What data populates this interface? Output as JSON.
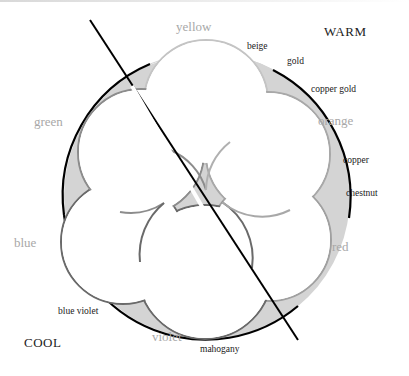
{
  "diagram": {
    "type": "hair-color-wheel",
    "temperature_labels": {
      "warm": "WARM",
      "cool": "COOL"
    },
    "primary_colors": [
      {
        "key": "yellow",
        "label": "yellow"
      },
      {
        "key": "orange",
        "label": "orange"
      },
      {
        "key": "red",
        "label": "red"
      },
      {
        "key": "violet",
        "label": "violet"
      },
      {
        "key": "blue",
        "label": "blue"
      },
      {
        "key": "green",
        "label": "green"
      }
    ],
    "shades": [
      {
        "key": "beige",
        "label": "beige"
      },
      {
        "key": "gold",
        "label": "gold"
      },
      {
        "key": "copper_gold",
        "label": "copper gold"
      },
      {
        "key": "copper",
        "label": "copper"
      },
      {
        "key": "chestnut",
        "label": "chestnut"
      },
      {
        "key": "mahogany",
        "label": "mahogany"
      },
      {
        "key": "blue_violet",
        "label": "blue violet"
      }
    ],
    "colors": {
      "outer_ring_stroke": "#000000",
      "ring_fill": "#d4d4d4",
      "petal_fill": "#ffffff",
      "petal_stroke_light": "#b8b8b8",
      "petal_stroke_dark": "#6a6a6a",
      "color_label": "#a8a8a8",
      "shade_label": "#1a1a1a",
      "divider_line": "#000000"
    }
  }
}
